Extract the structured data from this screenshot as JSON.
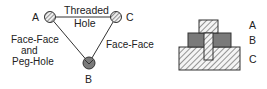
{
  "graph": {
    "nodes": [
      {
        "id": "A",
        "label": "A",
        "fill": "hatched"
      },
      {
        "id": "C",
        "label": "C",
        "fill": "hatched"
      },
      {
        "id": "B",
        "label": "B",
        "fill": "gray-with-v"
      }
    ],
    "edges": [
      {
        "from": "A",
        "to": "C",
        "label_line1": "Threaded",
        "label_line2": "Hole"
      },
      {
        "from": "A",
        "to": "B",
        "label_line1": "Face-Face",
        "label_line2": "and",
        "label_line3": "Peg-Hole"
      },
      {
        "from": "C",
        "to": "B",
        "label_line1": "Face-Face"
      }
    ]
  },
  "assembly": {
    "parts": [
      {
        "id": "A",
        "label": "A",
        "pattern": "hatched"
      },
      {
        "id": "B",
        "label": "B",
        "pattern": "solid-gray"
      },
      {
        "id": "C",
        "label": "C",
        "pattern": "hatched"
      }
    ]
  },
  "colors": {
    "line": "#333333",
    "gray_fill": "#7a7a7a",
    "hatch_bg": "#f2f2f2"
  }
}
